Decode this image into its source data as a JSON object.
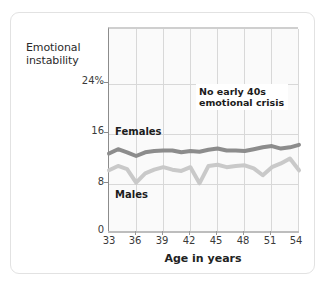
{
  "chart_data": {
    "type": "line",
    "title": "Emotional instability",
    "title_line1": "Emotional",
    "title_line2": "instability",
    "xlabel": "Age in years",
    "ylabel": "Emotional instability",
    "xlim": [
      33,
      54
    ],
    "ylim": [
      0,
      28
    ],
    "grid": true,
    "legend": "inline-labels",
    "yticks": [
      "0",
      "8",
      "16",
      "24%"
    ],
    "ytick_values": [
      0,
      8,
      16,
      24
    ],
    "xticks": [
      "33",
      "36",
      "39",
      "42",
      "45",
      "48",
      "51",
      "54"
    ],
    "xtick_values": [
      33,
      36,
      39,
      42,
      45,
      48,
      51,
      54
    ],
    "x": [
      33,
      34,
      35,
      36,
      37,
      38,
      39,
      40,
      41,
      42,
      43,
      44,
      45,
      46,
      47,
      48,
      49,
      50,
      51,
      52,
      53,
      54
    ],
    "series": [
      {
        "name": "Females",
        "color": "#8c8c8c",
        "values": [
          12.8,
          13.5,
          13.0,
          12.4,
          13.0,
          13.2,
          13.3,
          13.3,
          13.0,
          13.2,
          13.1,
          13.4,
          13.6,
          13.3,
          13.3,
          13.2,
          13.5,
          13.8,
          14.0,
          13.6,
          13.8,
          14.2
        ]
      },
      {
        "name": "Males",
        "color": "#c9c9c9",
        "values": [
          10.1,
          10.8,
          10.3,
          8.1,
          9.6,
          10.2,
          10.6,
          10.2,
          10.0,
          10.6,
          8.0,
          10.8,
          11.0,
          10.6,
          10.8,
          10.9,
          10.4,
          9.3,
          10.6,
          11.2,
          12.0,
          10.1
        ]
      }
    ],
    "annotations": [
      {
        "name": "no-early-40s-crisis",
        "line1": "No early 40s",
        "line2": "emotional crisis"
      }
    ],
    "series_labels": [
      {
        "name": "Females"
      },
      {
        "name": "Males"
      }
    ]
  }
}
